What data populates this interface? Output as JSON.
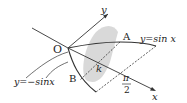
{
  "diagram": {
    "labels": {
      "origin": "O",
      "y_axis": "y",
      "x_axis": "x",
      "point_a": "A",
      "point_b": "B",
      "param_k": "k",
      "pi_num": "π",
      "pi_den": "2",
      "curve_upper": "y=sin x",
      "curve_lower": "y=−sinx"
    },
    "colors": {
      "line": "#333333",
      "shade": "#d9d9d9",
      "text": "#222222"
    }
  }
}
